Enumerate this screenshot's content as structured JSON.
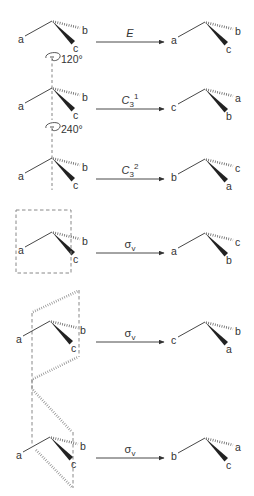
{
  "diagram": {
    "rows": [
      {
        "operation": {
          "symbol": "E",
          "superscript": "",
          "subscript": ""
        },
        "rotation_label": "",
        "element": "none",
        "before": {
          "left": "a",
          "hashed": "b",
          "wedge": "c"
        },
        "after": {
          "left": "a",
          "hashed": "b",
          "wedge": "c"
        }
      },
      {
        "operation": {
          "symbol": "C",
          "subscript": "3",
          "superscript": "1"
        },
        "rotation_label": "120°",
        "element": "rotation-axis",
        "before": {
          "left": "a",
          "hashed": "b",
          "wedge": "c"
        },
        "after": {
          "left": "c",
          "hashed": "a",
          "wedge": "b"
        }
      },
      {
        "operation": {
          "symbol": "C",
          "subscript": "3",
          "superscript": "2"
        },
        "rotation_label": "240°",
        "element": "rotation-axis",
        "before": {
          "left": "a",
          "hashed": "b",
          "wedge": "c"
        },
        "after": {
          "left": "b",
          "hashed": "c",
          "wedge": "a"
        }
      },
      {
        "operation": {
          "symbol": "σ",
          "subscript": "v",
          "superscript": ""
        },
        "rotation_label": "",
        "element": "mirror-plane-1",
        "before": {
          "left": "a",
          "hashed": "b",
          "wedge": "c"
        },
        "after": {
          "left": "a",
          "hashed": "c",
          "wedge": "b"
        }
      },
      {
        "operation": {
          "symbol": "σ",
          "subscript": "v",
          "superscript": ""
        },
        "rotation_label": "",
        "element": "mirror-plane-2",
        "before": {
          "left": "a",
          "hashed": "b",
          "wedge": "c"
        },
        "after": {
          "left": "c",
          "hashed": "b",
          "wedge": "a"
        }
      },
      {
        "operation": {
          "symbol": "σ",
          "subscript": "v",
          "superscript": ""
        },
        "rotation_label": "",
        "element": "mirror-plane-3",
        "before": {
          "left": "a",
          "hashed": "b",
          "wedge": "c"
        },
        "after": {
          "left": "b",
          "hashed": "a",
          "wedge": "c"
        }
      }
    ]
  }
}
